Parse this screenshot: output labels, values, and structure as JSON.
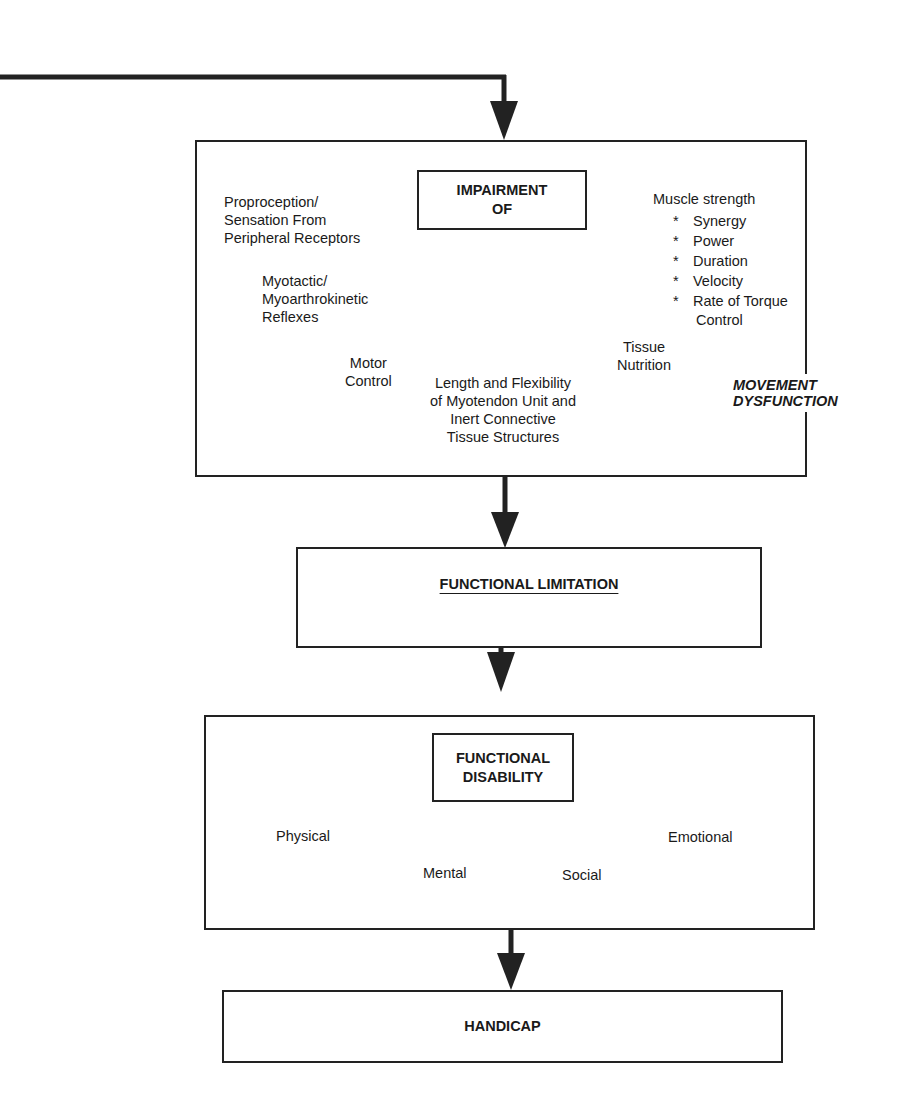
{
  "diagram": {
    "movement_dysfunction_box": {
      "side_label": [
        "MOVEMENT",
        "DYSFUNCTION"
      ],
      "center_box": {
        "lines": [
          "IMPAIRMENT",
          "OF"
        ]
      },
      "branches": {
        "proprioception": [
          "Proproception/",
          "Sensation From",
          "Peripheral Receptors"
        ],
        "reflexes": [
          "Myotactic/",
          "Myoarthrokinetic",
          "Reflexes"
        ],
        "motor_control": [
          "Motor",
          "Control"
        ],
        "length_flexibility": [
          "Length and Flexibility",
          "of Myotendon Unit and",
          "Inert Connective",
          "Tissue Structures"
        ],
        "tissue_nutrition": [
          "Tissue",
          "Nutrition"
        ],
        "muscle_strength": {
          "title": "Muscle strength",
          "items": [
            "Synergy",
            "Power",
            "Duration",
            "Velocity",
            "Rate of Torque"
          ],
          "continuation": "Control"
        }
      }
    },
    "functional_limitation": {
      "title": "FUNCTIONAL LIMITATION"
    },
    "functional_disability_box": {
      "center_box": {
        "lines": [
          "FUNCTIONAL",
          "DISABILITY"
        ]
      },
      "branches": [
        "Physical",
        "Mental",
        "Social",
        "Emotional"
      ]
    },
    "handicap": {
      "title": "HANDICAP"
    }
  },
  "colors": {
    "line": "#222222",
    "background": "#ffffff"
  }
}
